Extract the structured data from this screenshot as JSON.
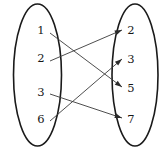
{
  "diagram": {
    "type": "set-mapping-arrow-diagram",
    "stroke_color": "#1a1a1a",
    "arrow_color": "#3a3a3a",
    "background": "#ffffff",
    "left_set": {
      "name": "domain-set",
      "shape": "ellipse",
      "cx": 37.5,
      "cy": 75,
      "rx": 24,
      "ry": 71,
      "elements": [
        {
          "label": "1",
          "x": 41,
          "y": 31
        },
        {
          "label": "2",
          "x": 41,
          "y": 59
        },
        {
          "label": "3",
          "x": 41,
          "y": 93
        },
        {
          "label": "6",
          "x": 41,
          "y": 120
        }
      ]
    },
    "right_set": {
      "name": "codomain-set",
      "shape": "ellipse",
      "cx": 135,
      "cy": 75,
      "rx": 23,
      "ry": 71,
      "elements": [
        {
          "label": "2",
          "x": 131,
          "y": 31
        },
        {
          "label": "3",
          "x": 131,
          "y": 60
        },
        {
          "label": "5",
          "x": 131,
          "y": 89
        },
        {
          "label": "7",
          "x": 131,
          "y": 120
        }
      ]
    },
    "arrows": [
      {
        "name": "arrow-1-to-5",
        "from": "1",
        "to": "5",
        "x1": 50,
        "y1": 33,
        "x2": 122,
        "y2": 87
      },
      {
        "name": "arrow-2-to-2",
        "from": "2",
        "to": "2",
        "x1": 50,
        "y1": 61,
        "x2": 122,
        "y2": 30
      },
      {
        "name": "arrow-3-to-7",
        "from": "3",
        "to": "7",
        "x1": 50,
        "y1": 94,
        "x2": 122,
        "y2": 118
      },
      {
        "name": "arrow-6-to-3",
        "from": "6",
        "to": "3",
        "x1": 50,
        "y1": 121,
        "x2": 122,
        "y2": 59
      }
    ]
  }
}
